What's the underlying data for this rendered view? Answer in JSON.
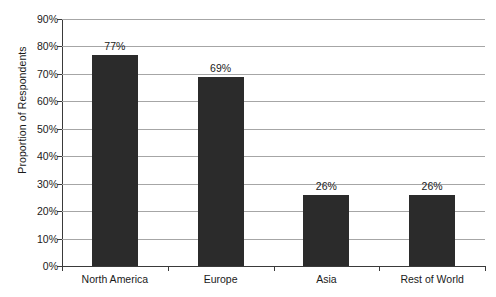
{
  "chart_data": {
    "type": "bar",
    "title": "",
    "subtitle": "",
    "xlabel": "",
    "ylabel": "Proportion of Respondents",
    "categories": [
      "North America",
      "Europe",
      "Asia",
      "Rest of World"
    ],
    "values": [
      77,
      69,
      26,
      26
    ],
    "value_labels": [
      "77%",
      "69%",
      "26%",
      "26%"
    ],
    "ylim": [
      0,
      90
    ],
    "ytick_values": [
      0,
      10,
      20,
      30,
      40,
      50,
      60,
      70,
      80,
      90
    ],
    "ytick_labels": [
      "0%",
      "10%",
      "20%",
      "30%",
      "40%",
      "50%",
      "60%",
      "70%",
      "80%",
      "90%"
    ],
    "grid": "horizontal",
    "legend": "none",
    "bar_color": "#2b2b2b",
    "gridline_color": "#a6a6a6",
    "axis_color": "#3a3a3a",
    "background_color": "#ffffff"
  }
}
